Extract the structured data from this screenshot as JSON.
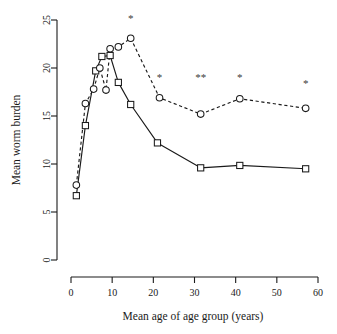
{
  "chart_data": {
    "type": "line",
    "title": "",
    "xlabel": "Mean age of age group (years)",
    "ylabel": "Mean worm burden",
    "xlim": [
      0,
      60
    ],
    "ylim": [
      0,
      25
    ],
    "xticks": [
      0,
      10,
      20,
      30,
      40,
      50,
      60
    ],
    "yticks": [
      0,
      5,
      10,
      15,
      20,
      25
    ],
    "xtick_labels": [
      "0",
      "10",
      "20",
      "30",
      "40",
      "50",
      "60"
    ],
    "ytick_labels": [
      "0",
      "5",
      "10",
      "15",
      "20",
      "25"
    ],
    "grid": false,
    "legend": "none",
    "series": [
      {
        "name": "solid-squares",
        "marker": "square",
        "linestyle": "solid",
        "points": [
          {
            "x": 1.3,
            "y": 6.7
          },
          {
            "x": 3.5,
            "y": 14.0
          },
          {
            "x": 6.0,
            "y": 19.7
          },
          {
            "x": 7.5,
            "y": 21.2
          },
          {
            "x": 9.5,
            "y": 21.3
          },
          {
            "x": 11.5,
            "y": 18.5
          },
          {
            "x": 14.5,
            "y": 16.2
          },
          {
            "x": 21.0,
            "y": 12.2
          },
          {
            "x": 31.5,
            "y": 9.6
          },
          {
            "x": 41.0,
            "y": 9.85
          },
          {
            "x": 57.0,
            "y": 9.5
          }
        ]
      },
      {
        "name": "dashed-circles",
        "marker": "circle",
        "linestyle": "dashed",
        "points": [
          {
            "x": 1.3,
            "y": 7.8
          },
          {
            "x": 3.5,
            "y": 16.3
          },
          {
            "x": 5.5,
            "y": 17.8
          },
          {
            "x": 7.0,
            "y": 20.0
          },
          {
            "x": 8.5,
            "y": 17.7
          },
          {
            "x": 9.5,
            "y": 22.0
          },
          {
            "x": 11.5,
            "y": 22.2
          },
          {
            "x": 14.5,
            "y": 23.1
          },
          {
            "x": 21.5,
            "y": 16.9
          },
          {
            "x": 31.5,
            "y": 15.2
          },
          {
            "x": 41.0,
            "y": 16.8
          },
          {
            "x": 57.0,
            "y": 15.8
          }
        ]
      }
    ],
    "annotations": [
      {
        "text": "*",
        "x": 14.5,
        "y": 24.8
      },
      {
        "text": "*",
        "x": 21.5,
        "y": 18.6
      },
      {
        "text": "**",
        "x": 31.5,
        "y": 18.6
      },
      {
        "text": "*",
        "x": 41.0,
        "y": 18.6
      },
      {
        "text": "*",
        "x": 57.0,
        "y": 18.0
      }
    ]
  }
}
